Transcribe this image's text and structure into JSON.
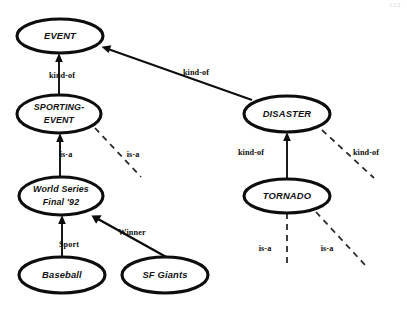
{
  "page": {
    "page_number": "122",
    "width": 407,
    "height": 318,
    "background_color": "#ffffff",
    "ink_color": "#0d0d0d"
  },
  "nodes": [
    {
      "id": "event",
      "label": "EVENT",
      "label_line2": "",
      "cx": 60,
      "cy": 36,
      "rx": 43,
      "ry": 17
    },
    {
      "id": "sporting-event",
      "label": "SPORTING-",
      "label_line2": "EVENT",
      "cx": 59,
      "cy": 114,
      "rx": 42,
      "ry": 19
    },
    {
      "id": "world-series",
      "label": "World Series",
      "label_line2": "Final '92",
      "cx": 61,
      "cy": 196,
      "rx": 42,
      "ry": 19
    },
    {
      "id": "baseball",
      "label": "Baseball",
      "label_line2": "",
      "cx": 62,
      "cy": 275,
      "rx": 43,
      "ry": 18
    },
    {
      "id": "sf-giants",
      "label": "SF Giants",
      "label_line2": "",
      "cx": 165,
      "cy": 275,
      "rx": 43,
      "ry": 18
    },
    {
      "id": "disaster",
      "label": "DISASTER",
      "label_line2": "",
      "cx": 287,
      "cy": 114,
      "rx": 43,
      "ry": 18
    },
    {
      "id": "tornado",
      "label": "TORNADO",
      "label_line2": "",
      "cx": 287,
      "cy": 196,
      "rx": 43,
      "ry": 17
    }
  ],
  "edges": [
    {
      "id": "sporting-event-to-event",
      "from": "sporting-event",
      "to": "event",
      "label": "kind-of",
      "style": "solid",
      "label_x": 62,
      "label_y": 76,
      "x1": 59,
      "y1": 95,
      "x2": 59,
      "y2": 55
    },
    {
      "id": "disaster-to-event",
      "from": "disaster",
      "to": "event",
      "label": "kind-of",
      "style": "solid",
      "label_x": 196,
      "label_y": 73,
      "x1": 252,
      "y1": 100,
      "x2": 102,
      "y2": 47
    },
    {
      "id": "world-series-to-sporting-event",
      "from": "world-series",
      "to": "sporting-event",
      "label": "is-a",
      "style": "solid",
      "label_x": 66,
      "label_y": 155,
      "x1": 60,
      "y1": 177,
      "x2": 60,
      "y2": 135
    },
    {
      "id": "sporting-event-instance-dashed",
      "from": "sporting-event",
      "to": "",
      "label": "is-a",
      "style": "dashed",
      "label_x": 133,
      "label_y": 155,
      "x1": 95,
      "y1": 128,
      "x2": 141,
      "y2": 177
    },
    {
      "id": "baseball-to-world-series",
      "from": "baseball",
      "to": "world-series",
      "label": "Sport",
      "style": "solid",
      "label_x": 69,
      "label_y": 245,
      "x1": 62,
      "y1": 257,
      "x2": 62,
      "y2": 217
    },
    {
      "id": "sf-giants-to-world-series",
      "from": "sf-giants",
      "to": "world-series",
      "label": "Winner",
      "style": "solid",
      "label_x": 132,
      "label_y": 233,
      "x1": 168,
      "y1": 258,
      "x2": 92,
      "y2": 216
    },
    {
      "id": "tornado-to-disaster",
      "from": "tornado",
      "to": "disaster",
      "label": "kind-of",
      "style": "solid",
      "label_x": 251,
      "label_y": 153,
      "x1": 287,
      "y1": 178,
      "x2": 287,
      "y2": 134
    },
    {
      "id": "disaster-instance-dashed",
      "from": "disaster",
      "to": "",
      "label": "kind-of",
      "style": "dashed",
      "label_x": 366,
      "label_y": 153,
      "x1": 322,
      "y1": 130,
      "x2": 374,
      "y2": 178
    },
    {
      "id": "tornado-instance-dashed-left",
      "from": "tornado",
      "to": "",
      "label": "is-a",
      "style": "dashed",
      "label_x": 265,
      "label_y": 249,
      "x1": 287,
      "y1": 213,
      "x2": 287,
      "y2": 265
    },
    {
      "id": "tornado-instance-dashed-right",
      "from": "tornado",
      "to": "",
      "label": "is-a",
      "style": "dashed",
      "label_x": 327,
      "label_y": 249,
      "x1": 316,
      "y1": 212,
      "x2": 366,
      "y2": 266
    }
  ]
}
